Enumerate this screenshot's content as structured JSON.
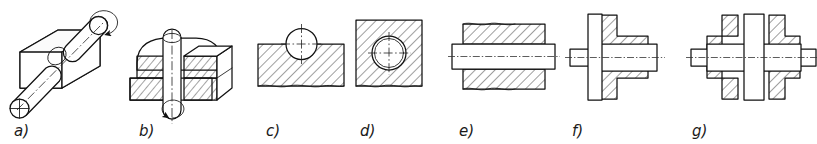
{
  "plate": {
    "title": "Pin and bore assembly — pictorial views and sectional views",
    "width": 817,
    "height": 144,
    "background_color": "#ffffff",
    "line_color": "#111111",
    "label_color": "#1a1a1a",
    "figure_count": 7
  },
  "figures": [
    {
      "id": "a",
      "label": "a)",
      "label_x": 14,
      "label_y": 136,
      "kind": "isometric-pictorial",
      "description": "Cylindrical pin passing through a rectangular block, shown in isometric projection with a curved rotation arrow at the upper pin end",
      "has_rotation_arrow": true,
      "has_centerline": true,
      "hatched": false
    },
    {
      "id": "b",
      "label": "b)",
      "label_x": 139,
      "label_y": 136,
      "kind": "isometric-cutaway",
      "description": "Vertical pin through a block shown cut away in isometric projection with hatched section faces and a rotation arrow below the pin",
      "has_rotation_arrow": true,
      "has_centerline": true,
      "hatched": true
    },
    {
      "id": "c",
      "label": "c)",
      "label_x": 266,
      "label_y": 136,
      "kind": "section-view",
      "description": "Sectional view of a block with a semicircular groove and a circle representing the pin resting in it, cross hatched",
      "has_rotation_arrow": false,
      "has_centerline": true,
      "hatched": true
    },
    {
      "id": "d",
      "label": "d)",
      "label_x": 360,
      "label_y": 136,
      "kind": "section-view",
      "description": "Sectional view of a square block with a circular bore containing the pin, cross hatched through the whole block",
      "has_rotation_arrow": false,
      "has_centerline": true,
      "hatched": true
    },
    {
      "id": "e",
      "label": "e)",
      "label_x": 459,
      "label_y": 136,
      "kind": "longitudinal-section",
      "description": "Longitudinal section of a plain shaft in a bore, shaft shown unsectioned between two hatched block halves, horizontal centreline",
      "has_rotation_arrow": false,
      "has_centerline": true,
      "hatched": true
    },
    {
      "id": "f",
      "label": "f)",
      "label_x": 572,
      "label_y": 136,
      "kind": "longitudinal-section",
      "description": "Longitudinal section of a stepped shaft with a collar passing through a hatched stepped bore",
      "has_rotation_arrow": false,
      "has_centerline": true,
      "hatched": true
    },
    {
      "id": "g",
      "label": "g)",
      "label_x": 692,
      "label_y": 136,
      "kind": "longitudinal-section",
      "description": "Longitudinal section of a shaft with a central rib or web passing through a symmetrical hatched housing on both sides",
      "has_rotation_arrow": false,
      "has_centerline": true,
      "hatched": true
    }
  ],
  "legend": {
    "hatching_note": "Section hatching at 45 degrees",
    "centerline_note": "Dash-dot centre lines mark axes of revolution"
  }
}
